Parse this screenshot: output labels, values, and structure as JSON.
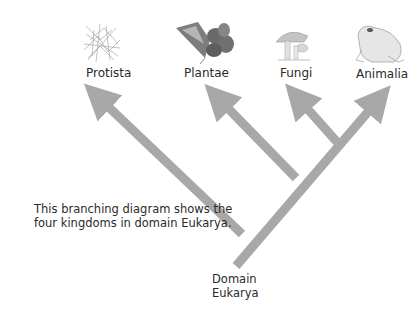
{
  "diagram": {
    "type": "cladogram",
    "root": {
      "label_line1": "Domain",
      "label_line2": "Eukarya"
    },
    "kingdoms": [
      {
        "name": "Protista",
        "icon": "protist-network-illustration"
      },
      {
        "name": "Plantae",
        "icon": "flower-plant-illustration"
      },
      {
        "name": "Fungi",
        "icon": "mushroom-illustration"
      },
      {
        "name": "Animalia",
        "icon": "frog-illustration"
      }
    ],
    "caption_line1": "This branching diagram shows the",
    "caption_line2": "four kingdoms in domain Eukarya.",
    "colors": {
      "branch": "#a8a8a8",
      "text": "#2a2a2a",
      "background": "#ffffff"
    }
  }
}
